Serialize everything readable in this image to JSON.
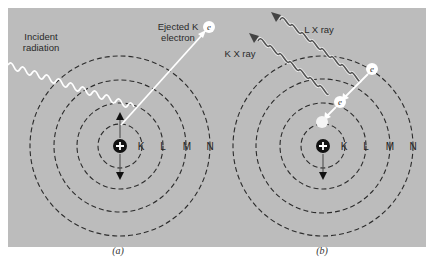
{
  "figure": {
    "panels": [
      {
        "id": "a",
        "caption": "(a)",
        "shells": [
          "K",
          "L",
          "M",
          "N"
        ],
        "labels": {
          "incident": [
            "Incident",
            "radiation"
          ],
          "ejected": [
            "Ejected K",
            "electron"
          ]
        },
        "electron_symbol": "e"
      },
      {
        "id": "b",
        "caption": "(b)",
        "shells": [
          "K",
          "L",
          "M",
          "N"
        ],
        "labels": {
          "k_xray": "K X ray",
          "l_xray": "L X ray"
        },
        "electron_symbol": "e"
      }
    ],
    "colors": {
      "background": "#ffffff",
      "panel": "#bcbcbc",
      "shell_line": "#2b2b2b",
      "incident_wave": "#ffffff",
      "xray_wave": "#555555",
      "nucleus": "#111111"
    }
  }
}
